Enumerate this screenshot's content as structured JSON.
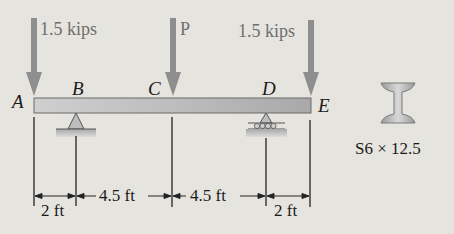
{
  "diagram": {
    "type": "beam-loading",
    "loads": [
      {
        "label": "1.5 kips",
        "at": "A"
      },
      {
        "label": "P",
        "at": "C"
      },
      {
        "label": "1.5 kips",
        "at": "E"
      }
    ],
    "points": {
      "A": "A",
      "B": "B",
      "C": "C",
      "D": "D",
      "E": "E"
    },
    "supports": {
      "B": "pin",
      "D": "roller"
    },
    "dimensions": [
      {
        "label": "2 ft",
        "from": "A",
        "to": "B"
      },
      {
        "label": "4.5 ft",
        "from": "B",
        "to": "C"
      },
      {
        "label": "4.5 ft",
        "from": "C",
        "to": "D"
      },
      {
        "label": "2 ft",
        "from": "D",
        "to": "E"
      }
    ],
    "section": {
      "label": "S6 × 12.5"
    },
    "colors": {
      "background": "#e6e4df",
      "beam": "#b9b9b9",
      "load_arrow": "#8e8e8e",
      "load_text": "#6e6e6e",
      "line": "#222222"
    }
  }
}
